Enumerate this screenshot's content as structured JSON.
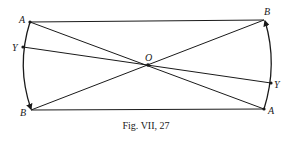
{
  "figure": {
    "caption": "Fig. VII, 27",
    "points": {
      "A_left": {
        "label": "A",
        "x": 30,
        "y": 22
      },
      "Y_left": {
        "label": "Y",
        "x": 23,
        "y": 47
      },
      "B_left": {
        "label": "B",
        "x": 31,
        "y": 110
      },
      "B_right": {
        "label": "B",
        "x": 264,
        "y": 20
      },
      "Y_right": {
        "label": "Y",
        "x": 271,
        "y": 83
      },
      "A_right": {
        "label": "A",
        "x": 264,
        "y": 109
      },
      "O": {
        "label": "O",
        "x": 148,
        "y": 65
      }
    },
    "line_color": "#1a1a1a"
  }
}
